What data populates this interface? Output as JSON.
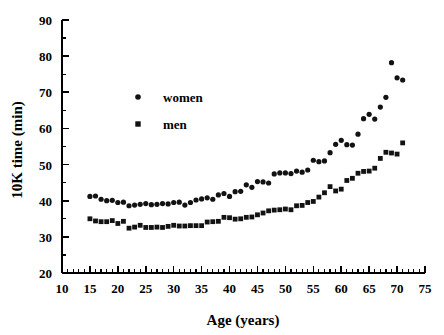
{
  "chart_data": {
    "type": "scatter",
    "title": "",
    "xlabel": "Age (years)",
    "ylabel": "10K time (min)",
    "xlim": [
      10,
      75
    ],
    "ylim": [
      20,
      90
    ],
    "xticks": [
      10,
      15,
      20,
      25,
      30,
      35,
      40,
      45,
      50,
      55,
      60,
      65,
      70,
      75
    ],
    "yticks": [
      20,
      30,
      40,
      50,
      60,
      70,
      80,
      90
    ],
    "x_minor_step": 1,
    "y_minor_step": 5,
    "grid": false,
    "legend_position": "upper-left-inside",
    "series": [
      {
        "name": "women",
        "marker": "circle",
        "color": "#121212",
        "points": [
          [
            15,
            41.2
          ],
          [
            16,
            41.3
          ],
          [
            17,
            40.4
          ],
          [
            18,
            40.0
          ],
          [
            19,
            40.1
          ],
          [
            20,
            39.5
          ],
          [
            21,
            39.6
          ],
          [
            22,
            38.6
          ],
          [
            23,
            38.8
          ],
          [
            24,
            39.0
          ],
          [
            25,
            39.2
          ],
          [
            26,
            38.9
          ],
          [
            27,
            39.0
          ],
          [
            28,
            39.2
          ],
          [
            29,
            39.1
          ],
          [
            30,
            39.5
          ],
          [
            31,
            39.6
          ],
          [
            32,
            38.8
          ],
          [
            33,
            39.5
          ],
          [
            34,
            40.2
          ],
          [
            35,
            40.5
          ],
          [
            36,
            40.8
          ],
          [
            37,
            40.4
          ],
          [
            38,
            41.6
          ],
          [
            39,
            42.0
          ],
          [
            40,
            41.2
          ],
          [
            41,
            42.5
          ],
          [
            42,
            42.6
          ],
          [
            43,
            44.4
          ],
          [
            44,
            43.7
          ],
          [
            45,
            45.3
          ],
          [
            46,
            45.2
          ],
          [
            47,
            44.9
          ],
          [
            48,
            47.4
          ],
          [
            49,
            47.7
          ],
          [
            50,
            47.7
          ],
          [
            51,
            47.5
          ],
          [
            52,
            48.2
          ],
          [
            53,
            47.9
          ],
          [
            54,
            48.5
          ],
          [
            55,
            51.2
          ],
          [
            56,
            50.8
          ],
          [
            57,
            51.0
          ],
          [
            58,
            53.3
          ],
          [
            59,
            55.6
          ],
          [
            60,
            56.7
          ],
          [
            61,
            55.5
          ],
          [
            62,
            55.4
          ],
          [
            63,
            58.4
          ],
          [
            64,
            62.7
          ],
          [
            65,
            63.9
          ],
          [
            66,
            62.6
          ],
          [
            67,
            65.9
          ],
          [
            68,
            68.6
          ],
          [
            69,
            78.2
          ],
          [
            70,
            74.0
          ],
          [
            71,
            73.4
          ]
        ]
      },
      {
        "name": "men",
        "marker": "square",
        "color": "#121212",
        "points": [
          [
            15,
            35.0
          ],
          [
            16,
            34.4
          ],
          [
            17,
            34.2
          ],
          [
            18,
            34.2
          ],
          [
            19,
            34.5
          ],
          [
            20,
            33.7
          ],
          [
            21,
            34.3
          ],
          [
            22,
            32.4
          ],
          [
            23,
            32.7
          ],
          [
            24,
            33.2
          ],
          [
            25,
            32.6
          ],
          [
            26,
            32.6
          ],
          [
            27,
            32.7
          ],
          [
            28,
            32.6
          ],
          [
            29,
            32.9
          ],
          [
            30,
            33.2
          ],
          [
            31,
            33.0
          ],
          [
            32,
            33.0
          ],
          [
            33,
            33.1
          ],
          [
            34,
            33.1
          ],
          [
            35,
            33.1
          ],
          [
            36,
            34.1
          ],
          [
            37,
            34.2
          ],
          [
            38,
            34.3
          ],
          [
            39,
            35.4
          ],
          [
            40,
            35.3
          ],
          [
            41,
            34.9
          ],
          [
            42,
            35.0
          ],
          [
            43,
            35.4
          ],
          [
            44,
            35.5
          ],
          [
            45,
            36.1
          ],
          [
            46,
            36.6
          ],
          [
            47,
            37.2
          ],
          [
            48,
            37.4
          ],
          [
            49,
            37.5
          ],
          [
            50,
            37.7
          ],
          [
            51,
            37.5
          ],
          [
            52,
            38.6
          ],
          [
            53,
            38.7
          ],
          [
            54,
            39.5
          ],
          [
            55,
            39.8
          ],
          [
            56,
            41.0
          ],
          [
            57,
            42.2
          ],
          [
            58,
            43.9
          ],
          [
            59,
            42.7
          ],
          [
            60,
            43.2
          ],
          [
            61,
            45.6
          ],
          [
            62,
            46.2
          ],
          [
            63,
            47.6
          ],
          [
            64,
            48.1
          ],
          [
            65,
            48.2
          ],
          [
            66,
            49.0
          ],
          [
            67,
            51.7
          ],
          [
            68,
            53.4
          ],
          [
            69,
            53.2
          ],
          [
            70,
            52.9
          ],
          [
            71,
            56.0
          ]
        ]
      }
    ],
    "legend": [
      {
        "label": "women",
        "marker": "circle"
      },
      {
        "label": "men",
        "marker": "square"
      }
    ]
  },
  "axes": {
    "x_title": "Age (years)",
    "y_title": "10K time (min)"
  },
  "legend": {
    "women_label": "women",
    "men_label": "men"
  },
  "x_tick_labels": [
    "10",
    "15",
    "20",
    "25",
    "30",
    "35",
    "40",
    "45",
    "50",
    "55",
    "60",
    "65",
    "70",
    "75"
  ],
  "y_tick_labels": [
    "20",
    "30",
    "40",
    "50",
    "60",
    "70",
    "80",
    "90"
  ]
}
